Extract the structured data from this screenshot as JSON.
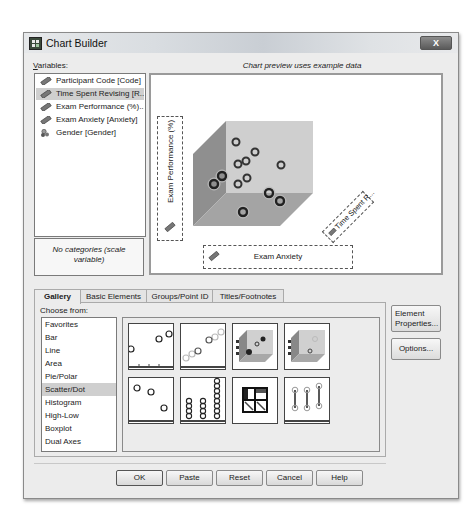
{
  "window": {
    "title": "Chart Builder",
    "close_label": "X"
  },
  "variables": {
    "label": "Variables:",
    "items": [
      {
        "label": "Participant Code [Code]",
        "type": "scale",
        "selected": false
      },
      {
        "label": "Time Spent Revising [R...",
        "type": "scale",
        "selected": true
      },
      {
        "label": "Exam Performance (%)...",
        "type": "scale",
        "selected": false
      },
      {
        "label": "Exam Anxiety [Anxiety]",
        "type": "scale",
        "selected": false
      },
      {
        "label": "Gender [Gender]",
        "type": "nominal",
        "selected": false
      }
    ],
    "categories_text_line1": "No categories (scale",
    "categories_text_line2": "variable)"
  },
  "preview": {
    "caption": "Chart preview uses example data",
    "y_axis_zone": "Exam Performance (%)",
    "x_axis_zone": "Exam Anxiety",
    "z_axis_zone": "Time Spent R...",
    "colors": {
      "cube_back": "#c8c8c8",
      "cube_side": "#9a9a9a",
      "cube_floor": "#a8a8a8"
    }
  },
  "tabs": [
    {
      "label": "Gallery",
      "active": true
    },
    {
      "label": "Basic Elements",
      "active": false
    },
    {
      "label": "Groups/Point ID",
      "active": false
    },
    {
      "label": "Titles/Footnotes",
      "active": false
    }
  ],
  "gallery": {
    "choose_label": "Choose from:",
    "chart_types": [
      {
        "label": "Favorites",
        "selected": false
      },
      {
        "label": "Bar",
        "selected": false
      },
      {
        "label": "Line",
        "selected": false
      },
      {
        "label": "Area",
        "selected": false
      },
      {
        "label": "Pie/Polar",
        "selected": false
      },
      {
        "label": "Scatter/Dot",
        "selected": true
      },
      {
        "label": "Histogram",
        "selected": false
      },
      {
        "label": "High-Low",
        "selected": false
      },
      {
        "label": "Boxplot",
        "selected": false
      },
      {
        "label": "Dual Axes",
        "selected": false
      }
    ],
    "thumbnails": [
      {
        "name": "simple-scatter"
      },
      {
        "name": "grouped-scatter"
      },
      {
        "name": "simple-3d-scatter",
        "selected": true
      },
      {
        "name": "grouped-3d-scatter"
      },
      {
        "name": "summary-point-plot"
      },
      {
        "name": "simple-dot-plot"
      },
      {
        "name": "scatterplot-matrix"
      },
      {
        "name": "drop-line"
      }
    ]
  },
  "side_buttons": {
    "element_properties_line1": "Element",
    "element_properties_line2": "Properties...",
    "options": "Options..."
  },
  "footer": {
    "ok": "OK",
    "paste": "Paste",
    "reset": "Reset",
    "cancel": "Cancel",
    "help": "Help"
  }
}
